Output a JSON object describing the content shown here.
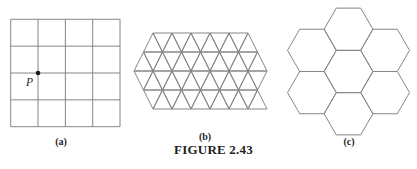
{
  "caption": {
    "text": "FIGURE 2.43"
  },
  "colors": {
    "line": "#858585",
    "text": "#1f1f1f",
    "point": "#1a1a1a",
    "background": "#ffffff"
  },
  "panels": {
    "a": {
      "label": "(a)",
      "type": "square-grid-tessellation",
      "point_label": "P",
      "grid": {
        "x": 10.7,
        "y": 19.3,
        "cols": 4,
        "rows": 4,
        "cellWidth": 27.33,
        "cellHeight": 26.85,
        "point": {
          "col": 1,
          "row": 2,
          "radius": 2.3
        }
      }
    },
    "b": {
      "label": "(b)",
      "type": "triangle-tessellation",
      "step": 19,
      "half": 9.5,
      "rows": [
        {
          "yTop": 33,
          "yBottom": 52,
          "upStart": 153,
          "upCount": 6,
          "downStart": 153,
          "downCount": 5
        },
        {
          "yTop": 52,
          "yBottom": 71,
          "upStart": 143.5,
          "upCount": 7,
          "downStart": 143.5,
          "downCount": 6
        },
        {
          "yTop": 71,
          "yBottom": 90,
          "upStart": 153,
          "upCount": 6,
          "downStart": 134,
          "downCount": 7
        },
        {
          "yTop": 90,
          "yBottom": 109,
          "upStart": 162.5,
          "upCount": 6,
          "downStart": 143.5,
          "downCount": 6
        }
      ]
    },
    "c": {
      "label": "(c)",
      "type": "hexagon-tessellation",
      "hex": {
        "radius": 24.4,
        "centerX": 348.5,
        "centerY": 71.5,
        "count": 7
      }
    }
  }
}
